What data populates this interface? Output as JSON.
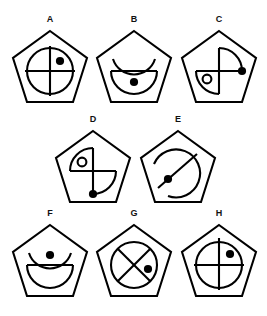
{
  "page": {
    "background_color": "#ffffff",
    "stroke_color": "#000000",
    "width": 267,
    "height": 316,
    "rows": 3
  },
  "figures": [
    {
      "label": "A",
      "row": 1,
      "position": "left",
      "outline": "pentagon",
      "inner_shape": "circle",
      "inner_detail": "crosshair-vertical-horizontal",
      "markers": [
        "filled-dot-upper-right-quadrant"
      ],
      "dot_count": 1,
      "small_circle": false
    },
    {
      "label": "B",
      "row": 1,
      "position": "center",
      "outline": "pentagon",
      "inner_shape": "broken-circle-open-top",
      "inner_detail": "horizontal-diameter-line",
      "markers": [
        "filled-dot-below-line"
      ],
      "dot_count": 1,
      "small_circle": false
    },
    {
      "label": "C",
      "row": 1,
      "position": "right",
      "outline": "pentagon",
      "inner_shape": "two-opposite-quarter-arcs-upper-right-lower-left",
      "inner_detail": "crosshair-vertical-horizontal",
      "markers": [
        "filled-dot-right-end-of-horizontal",
        "small-open-circle-lower-left"
      ],
      "dot_count": 1,
      "small_circle": true
    },
    {
      "label": "D",
      "row": 2,
      "position": "center-left",
      "outline": "pentagon",
      "inner_shape": "two-opposite-quarter-arcs-upper-left-lower-right",
      "inner_detail": "crosshair-vertical-horizontal",
      "markers": [
        "filled-dot-bottom-end-of-vertical",
        "small-open-circle-upper-left"
      ],
      "dot_count": 1,
      "small_circle": true
    },
    {
      "label": "E",
      "row": 2,
      "position": "center-right",
      "outline": "pentagon",
      "inner_shape": "spiral-broken-circle",
      "inner_detail": "diagonal-line-upper-right-to-lower-left",
      "markers": [
        "filled-dot-left-of-diagonal"
      ],
      "dot_count": 1,
      "small_circle": false
    },
    {
      "label": "F",
      "row": 3,
      "position": "left",
      "outline": "pentagon",
      "inner_shape": "broken-circle-open-top",
      "inner_detail": "horizontal-diameter-line",
      "markers": [
        "filled-dot-above-line"
      ],
      "dot_count": 1,
      "small_circle": false
    },
    {
      "label": "G",
      "row": 3,
      "position": "center",
      "outline": "pentagon",
      "inner_shape": "circle",
      "inner_detail": "x-cross-diagonals",
      "markers": [
        "filled-dot-right-quadrant"
      ],
      "dot_count": 1,
      "small_circle": false
    },
    {
      "label": "H",
      "row": 3,
      "position": "right",
      "outline": "pentagon",
      "inner_shape": "circle",
      "inner_detail": "crosshair-vertical-horizontal",
      "markers": [
        "filled-dot-upper-right-quadrant"
      ],
      "dot_count": 1,
      "small_circle": false
    }
  ]
}
